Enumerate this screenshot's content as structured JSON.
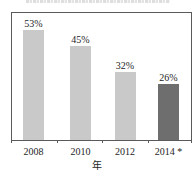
{
  "chart_data": {
    "type": "bar",
    "title": "",
    "categories": [
      "2008",
      "2010",
      "2012",
      "2014 *"
    ],
    "values": [
      53,
      45,
      32,
      26
    ],
    "value_labels": [
      "53%",
      "45%",
      "32%",
      "26%"
    ],
    "xlabel": "年",
    "ylabel": "",
    "ylim": [
      0,
      60
    ],
    "grid": false,
    "legend": null,
    "highlight_index": 3
  },
  "colors": {
    "bar_default": "#c9c9c9",
    "bar_highlight": "#6e6e6e",
    "axis": "#5a5a5a"
  }
}
